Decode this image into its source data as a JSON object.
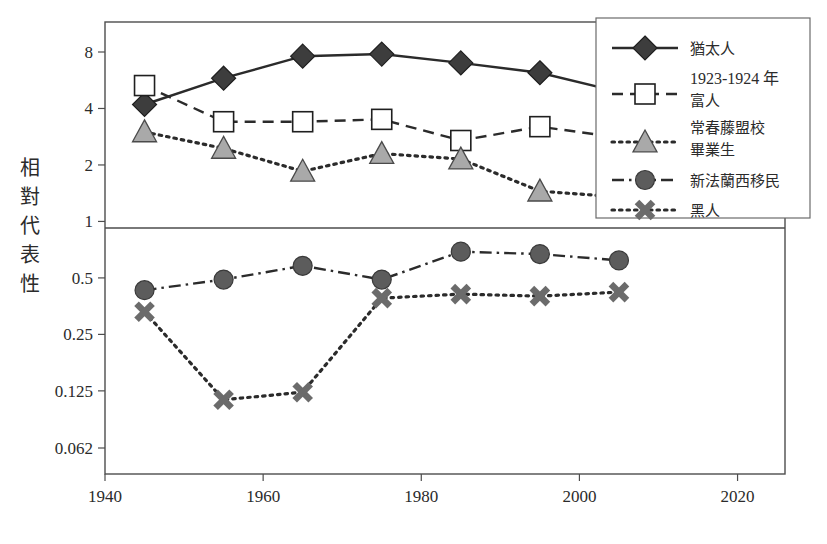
{
  "chart_data": {
    "type": "line",
    "title": "",
    "xlabel": "",
    "ylabel": "相對代表性",
    "xlim": [
      1940,
      2026
    ],
    "ylim": [
      0.055,
      10.5
    ],
    "yscale": "log2",
    "grid": false,
    "x_ticks": [
      "1940",
      "1960",
      "1980",
      "2000",
      "2020"
    ],
    "x_tick_values": [
      1940,
      1960,
      1980,
      2000,
      2020
    ],
    "y_ticks": [
      "8",
      "4",
      "2",
      "1",
      "0.5",
      "0.25",
      "0.125",
      "0.062"
    ],
    "y_tick_values": [
      8,
      4,
      2,
      1,
      0.5,
      0.25,
      0.125,
      0.062
    ],
    "x": [
      1945,
      1955,
      1965,
      1975,
      1985,
      1995,
      2005
    ],
    "legend_position": "right",
    "series": [
      {
        "name": "猶太人",
        "marker": "diamond",
        "line_style": "solid",
        "color": "#3d3d3d",
        "values": [
          4.2,
          5.8,
          7.6,
          7.8,
          7.0,
          6.2,
          4.9
        ]
      },
      {
        "name": "1923-1924 年\n富人",
        "name_line1": "1923-1924 年",
        "name_line2": "富人",
        "marker": "square",
        "line_style": "dashed",
        "color": "#ffffff",
        "values": [
          5.3,
          3.4,
          3.4,
          3.5,
          2.7,
          3.2,
          2.8
        ]
      },
      {
        "name": "常春藤盟校\n畢業生",
        "name_line1": "常春藤盟校",
        "name_line2": "畢業生",
        "marker": "triangle",
        "line_style": "dotted",
        "color": "#a9a9a9",
        "values": [
          3.0,
          2.45,
          1.85,
          2.3,
          2.15,
          1.45,
          1.35
        ]
      },
      {
        "name": "新法蘭西移民",
        "marker": "circle",
        "line_style": "dashdot",
        "color": "#5c5c5c",
        "values": [
          0.43,
          0.49,
          0.58,
          0.49,
          0.69,
          0.67,
          0.62
        ]
      },
      {
        "name": "黑人",
        "marker": "cross",
        "line_style": "dotted",
        "color": "#6b6b6b",
        "values": [
          0.33,
          0.112,
          0.123,
          0.39,
          0.41,
          0.4,
          0.42
        ]
      }
    ]
  },
  "axis": {
    "y_title": "相對代表性",
    "y_title_chars": [
      "相",
      "對",
      "代",
      "表",
      "性"
    ]
  },
  "legend": {
    "entries": [
      {
        "label": "猶太人",
        "label2": "",
        "marker": "diamond",
        "line_style": "solid"
      },
      {
        "label": "1923-1924 年",
        "label2": "富人",
        "marker": "square",
        "line_style": "dashed"
      },
      {
        "label": "常春藤盟校",
        "label2": "畢業生",
        "marker": "triangle",
        "line_style": "dotted"
      },
      {
        "label": "新法蘭西移民",
        "label2": "",
        "marker": "circle",
        "line_style": "dashdot"
      },
      {
        "label": "黑人",
        "label2": "",
        "marker": "cross",
        "line_style": "dotted"
      }
    ]
  },
  "colors": {
    "frame": "#4d4d4d",
    "text": "#2b2b2b",
    "diamond_fill": "#3d3d3d",
    "square_fill": "#ffffff",
    "triangle_fill": "#a9a9a9",
    "circle_fill": "#5c5c5c",
    "cross_stroke": "#6b6b6b"
  }
}
